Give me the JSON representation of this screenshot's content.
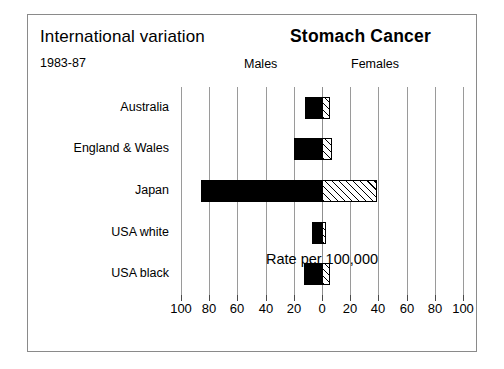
{
  "header": {
    "left_title": "International variation",
    "period": "1983-87",
    "main_title": "Stomach Cancer",
    "males_label": "Males",
    "females_label": "Females"
  },
  "chart_data": {
    "type": "bar",
    "orientation": "horizontal",
    "style": "bidirectional-population-pyramid",
    "title": "Stomach Cancer",
    "subtitle": "International variation",
    "period": "1983-87",
    "xlabel": "Rate per 100,000",
    "ylabel": "",
    "grid": true,
    "legend_position": "top-inline",
    "categories": [
      "Australia",
      "England & Wales",
      "Japan",
      "USA white",
      "USA black"
    ],
    "axis": {
      "left_max": 100,
      "right_max": 100,
      "tick_step": 20,
      "left_ticks": [
        100,
        80,
        60,
        40,
        20,
        0
      ],
      "right_ticks": [
        20,
        40,
        60,
        80,
        100
      ],
      "tick_labels": [
        "100",
        "80",
        "60",
        "40",
        "20",
        "0",
        "20",
        "40",
        "60",
        "80",
        "100"
      ]
    },
    "series": [
      {
        "name": "Males",
        "side": "left",
        "fill": "solid-black",
        "values": [
          12,
          20,
          86,
          7,
          13
        ]
      },
      {
        "name": "Females",
        "side": "right",
        "fill": "diagonal-hatch",
        "values": [
          6,
          7,
          39,
          3,
          6
        ]
      }
    ]
  },
  "colors": {
    "male_bar": "#000000",
    "female_bar_outline": "#000000",
    "female_bar_fill": "#ffffff",
    "gridline": "#9a9a9a",
    "border": "#8a8a8a",
    "text": "#000000"
  }
}
